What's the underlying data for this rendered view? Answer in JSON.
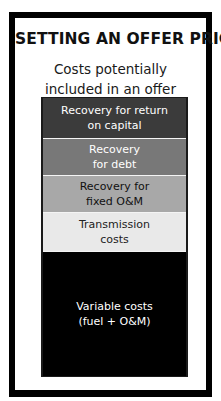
{
  "diagram": {
    "title": "SETTING AN OFFER PRICE",
    "subtitle": {
      "line1": "Costs potentially",
      "line2": "included in an offer"
    },
    "bands": [
      {
        "line1": "Recovery for return",
        "line2": "on capital",
        "fill": "#3b3b3b",
        "text_color": "#ffffff",
        "height": 41
      },
      {
        "line1": "Recovery",
        "line2": "for debt",
        "fill": "#787878",
        "text_color": "#ffffff",
        "height": 37
      },
      {
        "line1": "Recovery for",
        "line2": "fixed O&M",
        "fill": "#a8a8a8",
        "text_color": "#111111",
        "height": 37
      },
      {
        "line1": "Transmission",
        "line2": "costs",
        "fill": "#e9e9e9",
        "text_color": "#222222",
        "height": 39
      },
      {
        "line1": "Variable costs",
        "line2": "(fuel + O&M)",
        "fill": "#000000",
        "text_color": "#ffffff",
        "height": 124
      }
    ]
  }
}
